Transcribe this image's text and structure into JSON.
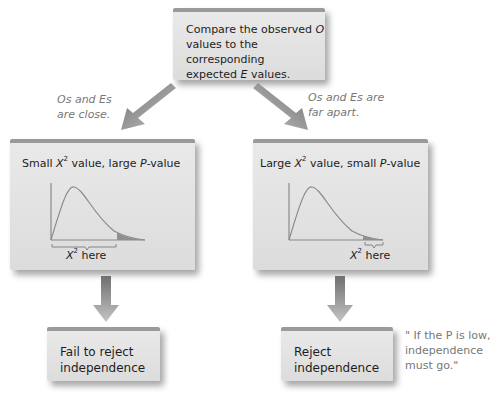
{
  "top_box": {
    "line1_a": "Compare the observed ",
    "line1_b": "O",
    "line2": "values to the corresponding",
    "line3_a": "expected ",
    "line3_b": "E",
    "line3_c": " values."
  },
  "left_branch": {
    "note_line1": "Os and Es",
    "note_line2": "are close.",
    "title_a": "Small ",
    "title_x": "X",
    "title_sup": "2",
    "title_b": " value, large ",
    "title_p": "P",
    "title_c": "-value",
    "label_x": "X",
    "label_sup": "2",
    "label_rest": " here",
    "result_line1": "Fail to reject",
    "result_line2": "independence"
  },
  "right_branch": {
    "note_line1": "Os and Es are",
    "note_line2": "far apart.",
    "title_a": "Large ",
    "title_x": "X",
    "title_sup": "2",
    "title_b": " value, small ",
    "title_p": "P",
    "title_c": "-value",
    "label_x": "X",
    "label_sup": "2",
    "label_rest": " here",
    "result_line1": "Reject",
    "result_line2": "independence"
  },
  "quote": {
    "line1": "\" If the P is low,",
    "line2": "independence",
    "line3": "must go.\""
  },
  "colors": {
    "box_fill": "#e3e3e3",
    "box_border_top": "#9a9a9a",
    "curve": "#8a8a8a",
    "tail_fill": "#8f8f8f",
    "arrow": "#8c8c8c",
    "note_text": "#777777"
  }
}
